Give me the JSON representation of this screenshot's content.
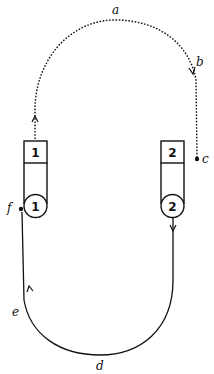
{
  "diagram": {
    "type": "circuit-loop",
    "points": {
      "a": "a",
      "b": "b",
      "c": "c",
      "d": "d",
      "e": "e",
      "f": "f"
    },
    "boxes": [
      {
        "id": "box-1",
        "label": "1"
      },
      {
        "id": "box-2",
        "label": "2"
      }
    ],
    "circles": [
      {
        "id": "circle-1",
        "label": "1"
      },
      {
        "id": "circle-2",
        "label": "2"
      }
    ],
    "paths": {
      "upper": "dotted",
      "lower": "solid"
    },
    "colors": {
      "stroke": "#111111",
      "background": "#ffffff"
    }
  }
}
